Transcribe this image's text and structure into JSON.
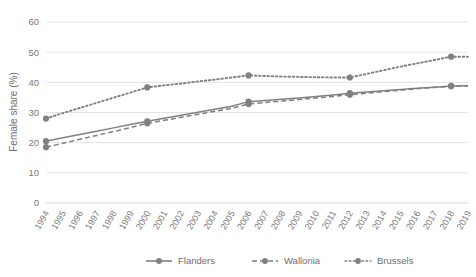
{
  "chart_data": {
    "type": "line",
    "title": "",
    "xlabel": "",
    "ylabel": "Female share (%)",
    "ylim": [
      0,
      60
    ],
    "yticks": [
      0,
      10,
      20,
      30,
      40,
      50,
      60
    ],
    "grid": true,
    "legend_position": "bottom",
    "marker_years": [
      1994,
      2000,
      2006,
      2012,
      2018
    ],
    "categories": [
      "1994",
      "1995",
      "1996",
      "1997",
      "1998",
      "1999",
      "2000",
      "2001",
      "2002",
      "2003",
      "2004",
      "2005",
      "2006",
      "2007",
      "2008",
      "2009",
      "2010",
      "2011",
      "2012",
      "2013",
      "2014",
      "2015",
      "2016",
      "2017",
      "2018",
      "2019"
    ],
    "series": [
      {
        "name": "Flanders",
        "style": "solid",
        "color": "#808080",
        "values": [
          20.5,
          21.6,
          22.7,
          23.8,
          24.9,
          26.0,
          27.1,
          28.1,
          29.1,
          30.1,
          31.1,
          32.1,
          33.6,
          34.0,
          34.4,
          34.8,
          35.3,
          35.8,
          36.4,
          36.8,
          37.2,
          37.6,
          38.0,
          38.4,
          38.8,
          38.9
        ]
      },
      {
        "name": "Wallonia",
        "style": "dashed",
        "color": "#808080",
        "values": [
          18.5,
          19.8,
          21.1,
          22.4,
          23.7,
          25.0,
          26.4,
          27.4,
          28.4,
          29.4,
          30.4,
          31.4,
          32.8,
          33.3,
          33.8,
          34.3,
          34.8,
          35.3,
          35.9,
          36.4,
          36.9,
          37.4,
          37.9,
          38.3,
          38.7,
          38.8
        ]
      },
      {
        "name": "Brussels",
        "style": "dotted",
        "color": "#808080",
        "values": [
          28.0,
          29.8,
          31.5,
          33.2,
          34.9,
          36.6,
          38.3,
          39.0,
          39.6,
          40.3,
          40.9,
          41.6,
          42.3,
          42.1,
          41.9,
          41.8,
          41.7,
          41.6,
          41.6,
          42.8,
          44.0,
          45.2,
          46.3,
          47.4,
          48.5,
          48.5
        ]
      }
    ]
  },
  "legend": {
    "items": [
      {
        "label": "Flanders"
      },
      {
        "label": "Wallonia"
      },
      {
        "label": "Brussels"
      }
    ]
  },
  "axis": {
    "y_title": "Female share (%)"
  }
}
